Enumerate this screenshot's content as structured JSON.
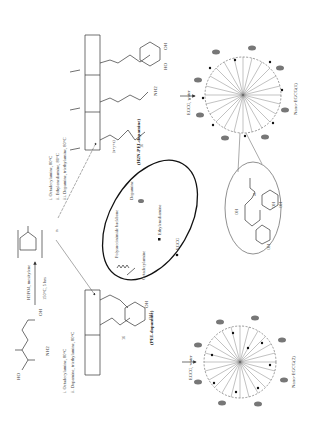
{
  "figure": {
    "orientation": "rotated-90-ccw",
    "start_material": {
      "label": "aspartic acid",
      "groups": [
        "HO",
        "O",
        "OH",
        "NH2"
      ]
    },
    "step1": {
      "top": "H3PO4, mesitylene",
      "bottom": "150°C, 5 hrs"
    },
    "psi": {
      "label": "n"
    },
    "route_left": {
      "conditions": [
        "i. Octadecylamine, 80°C",
        "ii. Dopamine, triethylamine, 80°C"
      ],
      "product": "(PEI-dopamine)",
      "labels": {
        "x": "x",
        "y": "y",
        "sub": "(x+y)",
        "chain": "16",
        "nh": "NH",
        "hn": "HN",
        "oh1": "OH",
        "oh2": "OH"
      },
      "reagent": "EGCG, water",
      "nano": "Nano-EGCG(2)"
    },
    "route_right": {
      "conditions": [
        "i. Octadecylamine, 80°C",
        "ii. Ethylenediamine, 80°C",
        "iii. Dopamine, triethylamine, 80°C"
      ],
      "product": "(H2N-PEI-dopamine)",
      "labels": {
        "x": "x",
        "y": "y",
        "z": "z",
        "sub": "(x+y+z)",
        "chain": "16",
        "nh2": "NH2",
        "ho": "HO",
        "oh": "OH"
      },
      "reagent": "EGCG, water",
      "nano": "Nano-EGCG(1)"
    },
    "legend": {
      "backbone": "Polysuccinimide backbone",
      "octadecylamine": "Octadecylamine",
      "dopamine": "Dopamine",
      "ethylenediamine": "Ethylenediamine",
      "egcg": "EGCG"
    },
    "inset": {
      "labels": [
        "N",
        "H",
        "OH",
        "OH",
        "OH",
        "O",
        "OH",
        "HO"
      ]
    }
  }
}
